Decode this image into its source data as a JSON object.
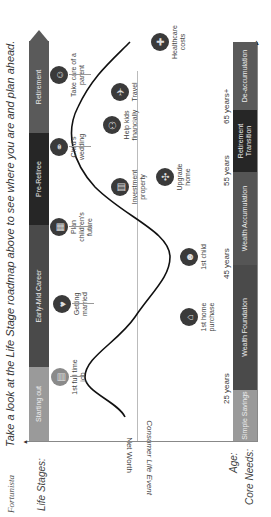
{
  "header": {
    "brand": "Fortunista",
    "intro_before": "Take a look at the ",
    "intro_emph": "Life Stage",
    "intro_after": " roadmap above to see where you are and plan ahead."
  },
  "row_labels": {
    "life_stages": "Life Stages:",
    "age": "Age:",
    "core_needs": "Core Needs:"
  },
  "axis_labels": {
    "net_worth": "Net Worth",
    "consumer_life_event": "Consumer Life Event"
  },
  "life_stages": [
    {
      "label": "Starting out",
      "color": "#9a9a9a"
    },
    {
      "label": "Early-Mid Career",
      "color": "#4a4a4a"
    },
    {
      "label": "Pre-Retiree",
      "color": "#262626"
    },
    {
      "label": "Retirement",
      "color": "#5a5a5a"
    }
  ],
  "ages": [
    "25 years",
    "45 years",
    "55 years",
    "65 years+"
  ],
  "core_needs": [
    {
      "label": "Simple Savings",
      "color": "#9a9a9a"
    },
    {
      "label": "Wealth Foundation",
      "color": "#4a4a4a"
    },
    {
      "label": "Wealth Accumulation",
      "color": "#555555"
    },
    {
      "label": "Retirement Transition",
      "color": "#262626"
    },
    {
      "label": "De-accumulation",
      "color": "#5a5a5a"
    }
  ],
  "events_above": [
    {
      "label": "1st full time job",
      "icon": "briefcase-icon"
    },
    {
      "label": "Getting married",
      "icon": "heart-icon"
    },
    {
      "label": "Plan children's future",
      "icon": "document-icon"
    },
    {
      "label": "Child's wedding",
      "icon": "wedding-icon"
    },
    {
      "label": "Take care of a parent",
      "icon": "family-icon"
    }
  ],
  "events_below": [
    {
      "label": "1st home purchase",
      "icon": "house-icon"
    },
    {
      "label": "1st child",
      "icon": "baby-icon"
    },
    {
      "label": "Upgrade home",
      "icon": "expand-icon"
    },
    {
      "label": "Investment property",
      "icon": "building-icon"
    },
    {
      "label": "Help kids financially",
      "icon": "hands-icon"
    },
    {
      "label": "Travel",
      "icon": "globe-icon"
    },
    {
      "label": "Healthcare costs",
      "icon": "medical-cross-icon"
    }
  ],
  "colors": {
    "icon_fill": "#3a3a3a",
    "icon_light_fill": "#8a8a8a",
    "curve": "#111111"
  }
}
